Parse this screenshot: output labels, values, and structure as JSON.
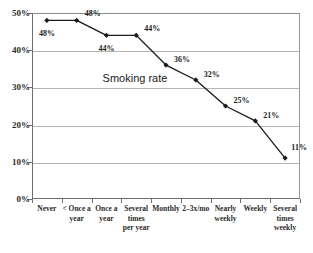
{
  "chart_data": {
    "type": "line",
    "title": "",
    "xlabel": "",
    "ylabel": "",
    "ylim": [
      0,
      50
    ],
    "grid": true,
    "legend_position": "none",
    "annotation": "Smoking rate",
    "categories": [
      "Never",
      "< Once a\nyear",
      "Once a\nyear",
      "Several\ntimes\nper year",
      "Monthly",
      "2–3x/mo",
      "Nearly\nweekly",
      "Weekly",
      "Several\ntimes\nweekly"
    ],
    "values": [
      48,
      48,
      44,
      44,
      36,
      32,
      25,
      21,
      11
    ],
    "point_labels": [
      "48%",
      "48%",
      "44%",
      "44%",
      "36%",
      "32%",
      "25%",
      "21%",
      "11%"
    ],
    "ytick_labels": [
      "50%",
      "40%",
      "30%",
      "20%",
      "10%",
      "0%"
    ],
    "ytick_values": [
      50,
      40,
      30,
      20,
      10,
      0
    ],
    "series_name": "Smoking rate",
    "line_color": "#1a1a1a",
    "marker_color": "#1a1a1a",
    "grid_color": "#b5b5b5",
    "axis_color": "#6f6f6f"
  },
  "top_sliver_text": ""
}
